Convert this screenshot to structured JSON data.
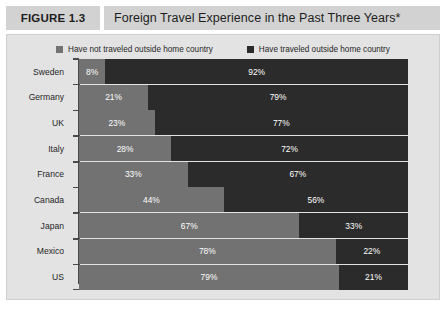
{
  "figure": {
    "number_label": "FIGURE 1.3",
    "title": "Foreign Travel Experience in the Past Three Years*"
  },
  "legend": {
    "entries": [
      {
        "label": "Have not traveled outside home country",
        "color": "#727272",
        "icon": "square-swatch-icon"
      },
      {
        "label": "Have traveled outside home country",
        "color": "#2b2b2b",
        "icon": "square-swatch-icon"
      }
    ]
  },
  "chart_data": {
    "type": "bar",
    "orientation": "horizontal",
    "stacked": true,
    "normalized_percent": true,
    "title": "Foreign Travel Experience in the Past Three Years*",
    "xlabel": "",
    "ylabel": "",
    "xlim": [
      0,
      100
    ],
    "grid": false,
    "legend_position": "top-center",
    "categories": [
      "Sweden",
      "Germany",
      "UK",
      "Italy",
      "France",
      "Canada",
      "Japan",
      "Mexico",
      "US"
    ],
    "series": [
      {
        "name": "Have not traveled outside home country",
        "color": "#727272",
        "values": [
          8,
          21,
          23,
          28,
          33,
          44,
          67,
          78,
          79
        ],
        "labels": [
          "8%",
          "21%",
          "23%",
          "28%",
          "33%",
          "44%",
          "67%",
          "78%",
          "79%"
        ]
      },
      {
        "name": "Have traveled outside home country",
        "color": "#2b2b2b",
        "values": [
          92,
          79,
          77,
          72,
          67,
          56,
          33,
          22,
          21
        ],
        "labels": [
          "92%",
          "79%",
          "77%",
          "72%",
          "67%",
          "56%",
          "33%",
          "22%",
          "21%"
        ]
      }
    ]
  },
  "colors": {
    "panel_background": "#e3e3e3",
    "title_band": "#d2d2d2",
    "axis": "#4a4a4a",
    "segment_not_traveled": "#727272",
    "segment_traveled": "#2b2b2b"
  }
}
